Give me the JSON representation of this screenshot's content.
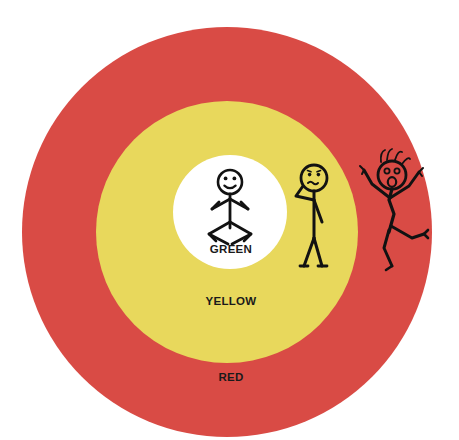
{
  "canvas": {
    "width": 459,
    "height": 440,
    "background_color": "#ffffff"
  },
  "diagram": {
    "type": "concentric-zones",
    "title_visible": false,
    "zones": [
      {
        "id": "red",
        "label": "RED",
        "color": "#d94b45",
        "center_x": 227,
        "center_y": 232,
        "radius": 205,
        "label_x": 231,
        "label_y": 381,
        "order": 1
      },
      {
        "id": "yellow",
        "label": "YELLOW",
        "color": "#e8d85c",
        "center_x": 227,
        "center_y": 232,
        "radius": 131,
        "label_x": 231,
        "label_y": 305,
        "order": 2
      },
      {
        "id": "green",
        "label": "GREEN",
        "color": "#ffffff",
        "center_x": 230,
        "center_y": 212,
        "radius": 57,
        "label_x": 231,
        "label_y": 253,
        "order": 3
      }
    ],
    "figures": [
      {
        "id": "calm-figure",
        "zone": "green",
        "mood": "calm-smiling",
        "mouth": "smile",
        "arms": "relaxed-chevron",
        "legs": "diamond-stance",
        "head_cx": 230,
        "head_cy": 182,
        "head_r": 12
      },
      {
        "id": "worried-figure",
        "zone": "yellow",
        "mood": "worried-thinking",
        "mouth": "wavy",
        "arms": "hand-on-chin",
        "legs": "standing",
        "head_cx": 314,
        "head_cy": 178,
        "head_r": 13
      },
      {
        "id": "panicked-figure",
        "zone": "red",
        "mood": "panicked-shocked",
        "mouth": "open-oval",
        "arms": "raised-v",
        "legs": "running-kick",
        "head_cx": 392,
        "head_cy": 175,
        "head_r": 14,
        "has_spiky_hair": true
      }
    ],
    "stroke_color": "#121212",
    "label_text_color": "#1a1a1a"
  }
}
